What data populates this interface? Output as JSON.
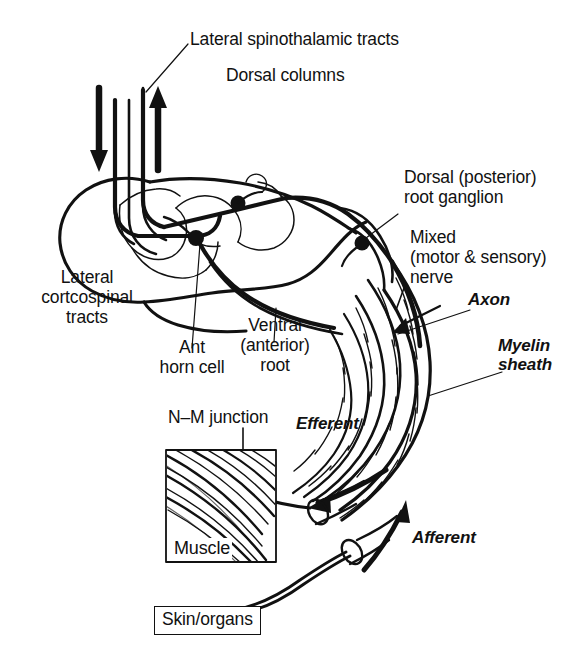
{
  "figure": {
    "kind": "anatomical-line-diagram",
    "background_color": "#ffffff",
    "ink_color": "#111111",
    "width": 580,
    "height": 664
  },
  "labels": {
    "lateral_spinothalamic": "Lateral spinothalamic tracts",
    "dorsal_columns": "Dorsal columns",
    "dorsal_root_ganglion": "Dorsal (posterior)\nroot ganglion",
    "mixed_nerve": "Mixed\n(motor & sensory)\nnerve",
    "axon": "Axon",
    "myelin_sheath": "Myelin\nsheath",
    "lateral_corticospinal": "Lateral\ncortcospinal\ntracts",
    "ant_horn_cell": "Ant\nhorn cell",
    "ventral_root": "Ventral\n(anterior)\nroot",
    "nm_junction": "N–M junction",
    "efferent": "Efferent",
    "afferent": "Afferent",
    "muscle": "Muscle",
    "skin_organs": "Skin/organs"
  },
  "arrows": [
    {
      "name": "descending-motor-arrow",
      "direction": "down",
      "meaning": "descending lateral corticospinal tract"
    },
    {
      "name": "ascending-sensory-arrow",
      "direction": "up",
      "meaning": "ascending lateral spinothalamic / dorsal columns"
    },
    {
      "name": "efferent-arrow",
      "direction": "down-left",
      "meaning": "efferent motor conduction toward muscle"
    },
    {
      "name": "afferent-arrow",
      "direction": "up-right",
      "meaning": "afferent sensory conduction toward cord"
    }
  ],
  "structures": [
    {
      "name": "spinal-cord-cross-section"
    },
    {
      "name": "grey-matter-butterfly"
    },
    {
      "name": "anterior-horn-cell-body"
    },
    {
      "name": "dorsal-root-ganglion-cell-body"
    },
    {
      "name": "interneuron-cell-body"
    },
    {
      "name": "peripheral-nerve-bundle"
    },
    {
      "name": "myelin-sheath-segments"
    },
    {
      "name": "neuromuscular-junction"
    },
    {
      "name": "muscle-fibres"
    },
    {
      "name": "cut-nerve-ends"
    }
  ]
}
